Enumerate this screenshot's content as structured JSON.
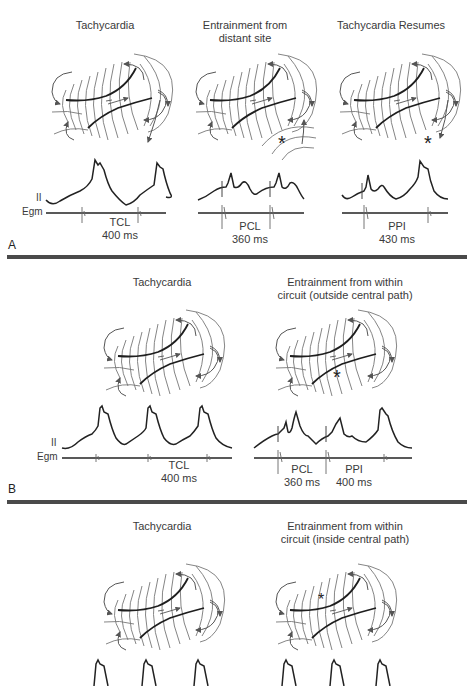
{
  "panels": {
    "A": {
      "letter": "A",
      "titles": [
        "Tachycardia",
        "Entrainment from distant site",
        "Tachycardia Resumes"
      ],
      "title_lines": [
        [
          "Tachycardia"
        ],
        [
          "Entrainment from",
          "distant site"
        ],
        [
          "Tachycardia Resumes"
        ]
      ],
      "lead_labels": {
        "ecg": "II",
        "egm": "Egm"
      },
      "intervals": [
        {
          "name": "TCL",
          "value": "400 ms"
        },
        {
          "name": "PCL",
          "value": "360 ms"
        },
        {
          "name": "PPI",
          "value": "430 ms"
        }
      ],
      "stimulus_marker": "*"
    },
    "B": {
      "letter": "B",
      "title_lines": [
        [
          "Tachycardia"
        ],
        [
          "Entrainment from within",
          "circuit (outside central path)"
        ]
      ],
      "lead_labels": {
        "ecg": "II",
        "egm": "Egm"
      },
      "intervals": [
        {
          "name": "TCL",
          "value": "400 ms"
        },
        {
          "name": "PCL",
          "value": "360 ms"
        },
        {
          "name": "PPI",
          "value": "400 ms"
        }
      ],
      "stimulus_marker": "*"
    },
    "C": {
      "title_lines": [
        [
          "Tachycardia"
        ],
        [
          "Entrainment from within",
          "circuit (inside central path)"
        ]
      ],
      "stimulus_marker": "*"
    }
  },
  "colors": {
    "line": "#2a2a2a",
    "thin_line": "#6a6a6a",
    "divider": "#4a4a4a",
    "text": "#3a3a3a"
  }
}
